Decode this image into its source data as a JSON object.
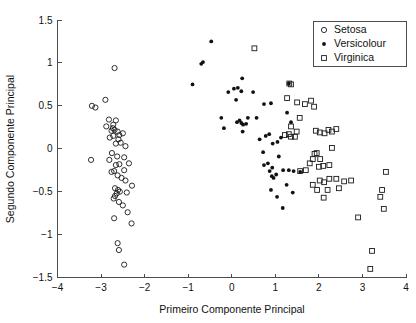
{
  "figure": {
    "width": 416,
    "height": 323,
    "background": "#ffffff"
  },
  "chart_data": {
    "type": "scatter",
    "title": "",
    "xlabel": "Primeiro Componente Principal",
    "ylabel": "Segundo Componente Principal",
    "xlim": [
      -4,
      4
    ],
    "ylim": [
      -1.5,
      1.5
    ],
    "xticks": [
      -4,
      -3,
      -2,
      -1,
      0,
      1,
      2,
      3,
      4
    ],
    "xticklabels": [
      "−4",
      "−3",
      "−2",
      "−1",
      "0",
      "1",
      "2",
      "3",
      "4"
    ],
    "yticks": [
      -1.5,
      -1,
      -0.5,
      0,
      0.5,
      1,
      1.5
    ],
    "yticklabels": [
      "−1.5",
      "−1",
      "−0.5",
      "0",
      "0.5",
      "1",
      "1.5"
    ],
    "grid": false,
    "legend": {
      "position": "top-right",
      "entries": [
        {
          "label": "Setosa",
          "marker": "open-circle",
          "color": "#1a1a1a"
        },
        {
          "label": "Versicolour",
          "marker": "filled-dot",
          "color": "#111111"
        },
        {
          "label": "Virginica",
          "marker": "open-square",
          "color": "#1a1a1a"
        }
      ]
    },
    "series": [
      {
        "name": "Setosa",
        "marker": "open-circle",
        "color": "#1a1a1a",
        "points": [
          [
            -2.69,
            0.94
          ],
          [
            -3.21,
            0.5
          ],
          [
            -2.9,
            0.57
          ],
          [
            -3.13,
            0.48
          ],
          [
            -2.82,
            0.34
          ],
          [
            -2.66,
            0.33
          ],
          [
            -2.73,
            0.24
          ],
          [
            -2.69,
            0.22
          ],
          [
            -2.76,
            0.21
          ],
          [
            -2.62,
            0.2
          ],
          [
            -2.58,
            0.16
          ],
          [
            -2.72,
            0.15
          ],
          [
            -2.8,
            0.13
          ],
          [
            -2.6,
            0.11
          ],
          [
            -2.5,
            0.18
          ],
          [
            -2.44,
            0.03
          ],
          [
            -3.23,
            -0.13
          ],
          [
            -2.75,
            -0.05
          ],
          [
            -2.63,
            -0.09
          ],
          [
            -2.47,
            -0.1
          ],
          [
            -2.81,
            -0.13
          ],
          [
            -2.58,
            -0.18
          ],
          [
            -2.66,
            -0.19
          ],
          [
            -2.7,
            -0.26
          ],
          [
            -2.76,
            -0.27
          ],
          [
            -2.62,
            -0.31
          ],
          [
            -2.53,
            -0.34
          ],
          [
            -2.44,
            -0.37
          ],
          [
            -2.29,
            -0.43
          ],
          [
            -2.68,
            -0.46
          ],
          [
            -2.61,
            -0.48
          ],
          [
            -2.57,
            -0.5
          ],
          [
            -2.64,
            -0.52
          ],
          [
            -2.68,
            -0.55
          ],
          [
            -2.71,
            -0.58
          ],
          [
            -2.59,
            -0.62
          ],
          [
            -2.5,
            -0.66
          ],
          [
            -2.39,
            -0.74
          ],
          [
            -2.7,
            -0.81
          ],
          [
            -2.3,
            -0.87
          ],
          [
            -2.62,
            -1.1
          ],
          [
            -2.59,
            -1.18
          ],
          [
            -2.47,
            -1.35
          ],
          [
            -2.88,
            0.26
          ],
          [
            -2.72,
            0.28
          ],
          [
            -2.66,
            0.06
          ],
          [
            -2.55,
            0.07
          ],
          [
            -2.47,
            -0.25
          ],
          [
            -2.36,
            -0.17
          ],
          [
            -2.41,
            -0.51
          ]
        ]
      },
      {
        "name": "Versicolour",
        "marker": "filled-dot",
        "color": "#111111",
        "points": [
          [
            -0.47,
            1.25
          ],
          [
            -0.66,
            1.01
          ],
          [
            -0.7,
            0.99
          ],
          [
            -0.9,
            0.75
          ],
          [
            0.24,
            0.82
          ],
          [
            0.05,
            0.7
          ],
          [
            0.14,
            0.71
          ],
          [
            0.22,
            0.67
          ],
          [
            -0.08,
            0.66
          ],
          [
            0.1,
            0.57
          ],
          [
            0.49,
            0.66
          ],
          [
            -0.24,
            0.36
          ],
          [
            -0.18,
            0.24
          ],
          [
            0.12,
            0.31
          ],
          [
            0.18,
            0.33
          ],
          [
            0.22,
            0.3
          ],
          [
            0.26,
            0.28
          ],
          [
            0.33,
            0.29
          ],
          [
            0.25,
            0.2
          ],
          [
            0.37,
            0.36
          ],
          [
            0.57,
            0.36
          ],
          [
            0.74,
            0.52
          ],
          [
            0.9,
            0.53
          ],
          [
            0.64,
            0.11
          ],
          [
            0.78,
            0.15
          ],
          [
            0.86,
            0.17
          ],
          [
            0.94,
            0.06
          ],
          [
            1.05,
            0.08
          ],
          [
            1.13,
            0.13
          ],
          [
            1.27,
            0.42
          ],
          [
            1.36,
            0.31
          ],
          [
            1.31,
            0.76
          ],
          [
            0.72,
            -0.04
          ],
          [
            0.83,
            -0.17
          ],
          [
            0.93,
            -0.22
          ],
          [
            0.87,
            -0.26
          ],
          [
            0.74,
            -0.19
          ],
          [
            1.08,
            -0.09
          ],
          [
            1.18,
            -0.25
          ],
          [
            1.31,
            -0.25
          ],
          [
            1.42,
            -0.26
          ],
          [
            1.57,
            -0.27
          ],
          [
            1.26,
            -0.42
          ],
          [
            0.92,
            -0.32
          ],
          [
            0.96,
            -0.34
          ],
          [
            1.02,
            -0.3
          ],
          [
            0.9,
            -0.48
          ],
          [
            1.04,
            -0.56
          ],
          [
            1.4,
            -0.51
          ],
          [
            1.17,
            -0.69
          ]
        ]
      },
      {
        "name": "Virginica",
        "marker": "open-square",
        "color": "#1a1a1a",
        "points": [
          [
            0.52,
            1.17
          ],
          [
            1.32,
            0.76
          ],
          [
            1.36,
            0.75
          ],
          [
            1.27,
            0.59
          ],
          [
            1.5,
            0.54
          ],
          [
            1.68,
            0.52
          ],
          [
            1.89,
            0.49
          ],
          [
            1.82,
            0.56
          ],
          [
            1.36,
            0.26
          ],
          [
            1.49,
            0.2
          ],
          [
            1.56,
            0.36
          ],
          [
            1.31,
            0.17
          ],
          [
            1.36,
            0.14
          ],
          [
            1.45,
            0.14
          ],
          [
            1.22,
            0.16
          ],
          [
            1.93,
            0.21
          ],
          [
            2.13,
            0.18
          ],
          [
            2.22,
            0.22
          ],
          [
            2.3,
            0.2
          ],
          [
            2.4,
            0.23
          ],
          [
            2.02,
            0.19
          ],
          [
            2.3,
            0.01
          ],
          [
            1.9,
            -0.06
          ],
          [
            1.95,
            -0.05
          ],
          [
            2.03,
            -0.12
          ],
          [
            2.1,
            -0.2
          ],
          [
            2.24,
            -0.19
          ],
          [
            1.86,
            -0.12
          ],
          [
            1.79,
            -0.17
          ],
          [
            2.0,
            -0.21
          ],
          [
            1.86,
            -0.42
          ],
          [
            2.02,
            -0.37
          ],
          [
            2.12,
            -0.39
          ],
          [
            2.24,
            -0.35
          ],
          [
            2.4,
            -0.35
          ],
          [
            2.58,
            -0.38
          ],
          [
            2.74,
            -0.37
          ],
          [
            1.96,
            -0.48
          ],
          [
            2.2,
            -0.48
          ],
          [
            2.11,
            -0.57
          ],
          [
            2.46,
            -0.46
          ],
          [
            3.54,
            -0.27
          ],
          [
            3.45,
            -0.48
          ],
          [
            3.41,
            -0.56
          ],
          [
            2.9,
            -0.8
          ],
          [
            3.18,
            -1.4
          ],
          [
            3.22,
            -1.19
          ],
          [
            3.49,
            -0.7
          ],
          [
            1.57,
            -0.26
          ],
          [
            1.7,
            -0.25
          ]
        ]
      }
    ]
  },
  "axes": {
    "x_title": "Primeiro Componente Principal",
    "y_title": "Segundo Componente Principal"
  }
}
